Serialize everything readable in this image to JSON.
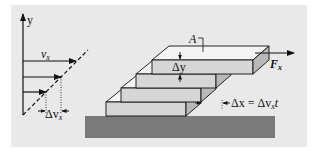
{
  "figure": {
    "background": "#e9e9e9",
    "plate_front_color": "#d6d6d6",
    "plate_top_color": "#f4f4f4",
    "plate_side_color": "#b8b8b8",
    "base_color": "#7a7a7a",
    "line_color": "#111111"
  },
  "velocity_profile": {
    "axis_label": "y",
    "velocity_label": "v",
    "velocity_subscript": "x",
    "delta_label": "Δv",
    "delta_subscript": "x",
    "arrow_count": 3
  },
  "plate_stack": {
    "plate_count": 4,
    "area_label": "A",
    "thickness_label": "Δy",
    "force_label": "F",
    "force_subscript": "x",
    "displacement_label_left": "Δx = Δv",
    "displacement_subscript": "x",
    "displacement_label_right": "t"
  }
}
